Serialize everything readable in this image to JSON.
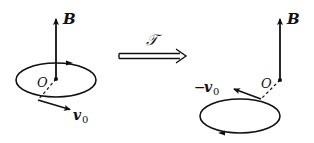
{
  "diagram": {
    "colors": {
      "stroke": "#111111",
      "background": "#ffffff"
    },
    "left": {
      "field_label": "B",
      "origin_label": "O",
      "velocity_label": "v",
      "velocity_subscript": "0",
      "orbit_direction": "counterclockwise-from-top (arrow on top pointing right)"
    },
    "transform": {
      "operator_label": "𝒯",
      "arrow": "double-line right arrow"
    },
    "right": {
      "field_label": "B",
      "origin_label": "O",
      "velocity_prefix": "−",
      "velocity_label": "v",
      "velocity_subscript": "0",
      "orbit_direction": "reversed (arrow on bottom pointing left)"
    }
  }
}
